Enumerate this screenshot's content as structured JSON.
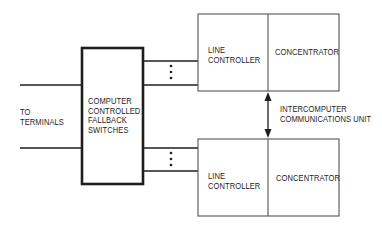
{
  "diagram": {
    "terminals_label": {
      "line1": "TO",
      "line2": "TERMINALS"
    },
    "fallback_switches": {
      "line1": "COMPUTER",
      "line2": "CONTROLLED",
      "line3": "FALLBACK",
      "line4": "SWITCHES"
    },
    "upper_unit": {
      "line_controller": {
        "line1": "LINE",
        "line2": "CONTROLLER"
      },
      "concentrator": "CONCENTRATOR"
    },
    "lower_unit": {
      "line_controller": {
        "line1": "LINE",
        "line2": "CONTROLLER"
      },
      "concentrator": "CONCENTRATOR"
    },
    "intercomputer_link": {
      "line1": "INTERCOMPUTER",
      "line2": "COMMUNICATIONS UNIT"
    },
    "continuation_marker": "⋮",
    "colors": {
      "background": "#ffffff",
      "line": "#1e1e1e",
      "box_border_light": "#555555"
    }
  }
}
